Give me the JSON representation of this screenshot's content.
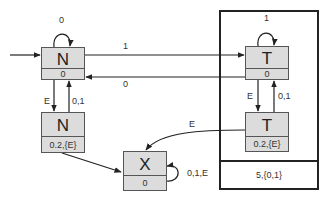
{
  "diagram": {
    "type": "state-machine",
    "group": {
      "label": "5,{0,1}"
    },
    "nodes": {
      "n_top": {
        "name": "N",
        "value": "0"
      },
      "n_bottom": {
        "name": "N",
        "value": "0.2,{E}"
      },
      "t_top": {
        "name": "T",
        "value": "0"
      },
      "t_bottom": {
        "name": "T",
        "value": "0.2,{E}"
      },
      "x": {
        "name": "X",
        "value": "0"
      }
    },
    "edges": {
      "start_to_n": "",
      "n_self": "0",
      "n_to_t": "1",
      "t_to_n": "0",
      "t_self": "1",
      "n_down": "E",
      "n_up": "0,1",
      "t_down": "E",
      "t_up": "0,1",
      "t_bottom_to_x": "E",
      "n_bottom_to_x": "",
      "x_self": "0,1,E"
    },
    "colors": {
      "node_fill": "#dcdcdc",
      "node_border": "#555555",
      "line": "#222222"
    }
  }
}
